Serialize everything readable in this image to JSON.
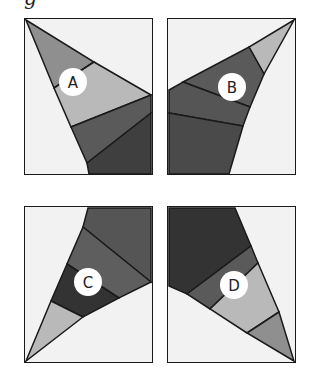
{
  "caption": "g",
  "colors": {
    "background": "#f2f2f2",
    "border": "#1a1a1a",
    "light": "#b9b9b9",
    "medium": "#8f8f8f",
    "dark": "#5a5a5a",
    "darker": "#444444",
    "darkest": "#333333",
    "label_circle": "#ffffff"
  },
  "panels": [
    {
      "id": "A",
      "label": "A"
    },
    {
      "id": "B",
      "label": "B"
    },
    {
      "id": "C",
      "label": "C"
    },
    {
      "id": "D",
      "label": "D"
    }
  ]
}
